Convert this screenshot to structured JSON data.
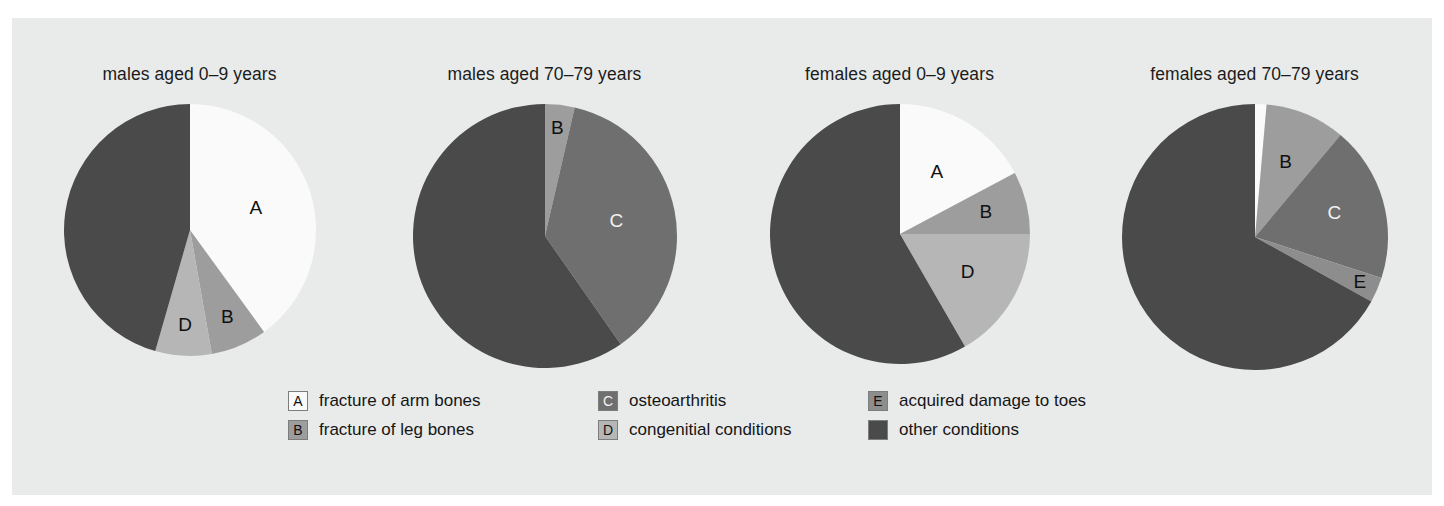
{
  "figure": {
    "background_color": "#e9ebeb",
    "page_background": "#ffffff"
  },
  "palette": {
    "A": "#fafafa",
    "B": "#9d9d9d",
    "C": "#6f6f6f",
    "D": "#b6b6b6",
    "E": "#8d8d8d",
    "other": "#4a4a4a",
    "swatch_border": "#7d7d7d",
    "text": "#161616"
  },
  "legend": {
    "columns": [
      [
        {
          "key": "A",
          "label": "fracture of arm bones",
          "color": "#fafafa",
          "letter": "A",
          "letter_on_dark": false
        },
        {
          "key": "B",
          "label": "fracture of leg bones",
          "color": "#9d9d9d",
          "letter": "B",
          "letter_on_dark": false
        }
      ],
      [
        {
          "key": "C",
          "label": "osteoarthritis",
          "color": "#6f6f6f",
          "letter": "C",
          "letter_on_dark": true
        },
        {
          "key": "D",
          "label": "congenitial conditions",
          "color": "#b6b6b6",
          "letter": "D",
          "letter_on_dark": false
        }
      ],
      [
        {
          "key": "E",
          "label": "acquired damage to toes",
          "color": "#8d8d8d",
          "letter": "E",
          "letter_on_dark": false
        },
        {
          "key": "other",
          "label": "other conditions",
          "color": "#4a4a4a",
          "letter": "",
          "letter_on_dark": true
        }
      ]
    ]
  },
  "chart_data": {
    "type": "pie",
    "title": "",
    "subtitle": "",
    "legend_position": "bottom",
    "legend_entries": [
      "fracture of arm bones",
      "fracture of leg bones",
      "osteoarthritis",
      "congenitial conditions",
      "acquired damage to toes",
      "other conditions"
    ],
    "value_unit": "percent",
    "start_angle_deg": 0,
    "direction": "clockwise",
    "panels": [
      {
        "title": "males aged 0–9 years",
        "center_x": 252,
        "center_y": 230,
        "radius": 126,
        "slices": [
          {
            "key": "A",
            "label": "A",
            "category": "fracture of arm bones",
            "value": 40.0,
            "start_deg": 0,
            "end_deg": 144,
            "color": "#fafafa",
            "show_label": true,
            "label_on_dark": false,
            "label_radius_frac": 0.55
          },
          {
            "key": "B",
            "label": "B",
            "category": "fracture of leg bones",
            "value": 7.2,
            "start_deg": 144,
            "end_deg": 170,
            "color": "#9d9d9d",
            "show_label": true,
            "label_on_dark": false,
            "label_radius_frac": 0.76
          },
          {
            "key": "D",
            "label": "D",
            "category": "congenitial conditions",
            "value": 7.2,
            "start_deg": 170,
            "end_deg": 196,
            "color": "#b6b6b6",
            "show_label": true,
            "label_on_dark": false,
            "label_radius_frac": 0.76
          },
          {
            "key": "other",
            "label": "",
            "category": "other conditions",
            "value": 45.6,
            "start_deg": 196,
            "end_deg": 360,
            "color": "#4a4a4a",
            "show_label": false,
            "label_on_dark": true,
            "label_radius_frac": 0.6
          }
        ]
      },
      {
        "title": "males aged 70–79 years",
        "center_x": 590,
        "center_y": 236,
        "radius": 132,
        "slices": [
          {
            "key": "B",
            "label": "B",
            "category": "fracture of leg bones",
            "value": 3.6,
            "start_deg": 0,
            "end_deg": 13,
            "color": "#9d9d9d",
            "show_label": true,
            "label_on_dark": false,
            "label_radius_frac": 0.82
          },
          {
            "key": "C",
            "label": "C",
            "category": "osteoarthritis",
            "value": 36.7,
            "start_deg": 13,
            "end_deg": 145,
            "color": "#6f6f6f",
            "show_label": true,
            "label_on_dark": true,
            "label_radius_frac": 0.55
          },
          {
            "key": "other",
            "label": "",
            "category": "other conditions",
            "value": 59.7,
            "start_deg": 145,
            "end_deg": 360,
            "color": "#4a4a4a",
            "show_label": false,
            "label_on_dark": true,
            "label_radius_frac": 0.6
          }
        ]
      },
      {
        "title": "females aged 0–9 years",
        "center_x": 872,
        "center_y": 240,
        "radius": 130,
        "slices": [
          {
            "key": "A",
            "label": "A",
            "category": "fracture of arm bones",
            "value": 17.2,
            "start_deg": 0,
            "end_deg": 62,
            "color": "#fafafa",
            "show_label": true,
            "label_on_dark": false,
            "label_radius_frac": 0.55
          },
          {
            "key": "B",
            "label": "B",
            "category": "fracture of leg bones",
            "value": 7.8,
            "start_deg": 62,
            "end_deg": 90,
            "color": "#9d9d9d",
            "show_label": true,
            "label_on_dark": false,
            "label_radius_frac": 0.68
          },
          {
            "key": "D",
            "label": "D",
            "category": "congenitial conditions",
            "value": 16.7,
            "start_deg": 90,
            "end_deg": 150,
            "color": "#b6b6b6",
            "show_label": true,
            "label_on_dark": false,
            "label_radius_frac": 0.6
          },
          {
            "key": "other",
            "label": "",
            "category": "other conditions",
            "value": 58.3,
            "start_deg": 150,
            "end_deg": 360,
            "color": "#4a4a4a",
            "show_label": false,
            "label_on_dark": true,
            "label_radius_frac": 0.6
          }
        ]
      },
      {
        "title": "females aged 70–79 years",
        "center_x": 1200,
        "center_y": 236,
        "radius": 133,
        "slices": [
          {
            "key": "A",
            "label": "A",
            "category": "fracture of arm bones",
            "value": 1.4,
            "start_deg": 0,
            "end_deg": 5,
            "color": "#fafafa",
            "show_label": true,
            "label_on_dark": false,
            "label_radius_frac": 1.12
          },
          {
            "key": "B",
            "label": "B",
            "category": "fracture of leg bones",
            "value": 9.7,
            "start_deg": 5,
            "end_deg": 40,
            "color": "#9d9d9d",
            "show_label": true,
            "label_on_dark": false,
            "label_radius_frac": 0.6
          },
          {
            "key": "C",
            "label": "C",
            "category": "osteoarthritis",
            "value": 18.9,
            "start_deg": 40,
            "end_deg": 108,
            "color": "#6f6f6f",
            "show_label": true,
            "label_on_dark": true,
            "label_radius_frac": 0.62
          },
          {
            "key": "E",
            "label": "E",
            "category": "acquired damage to toes",
            "value": 3.1,
            "start_deg": 108,
            "end_deg": 119,
            "color": "#8d8d8d",
            "show_label": true,
            "label_on_dark": false,
            "label_radius_frac": 0.86
          },
          {
            "key": "other",
            "label": "",
            "category": "other conditions",
            "value": 66.9,
            "start_deg": 119,
            "end_deg": 360,
            "color": "#4a4a4a",
            "show_label": false,
            "label_on_dark": true,
            "label_radius_frac": 0.6
          }
        ]
      }
    ]
  }
}
